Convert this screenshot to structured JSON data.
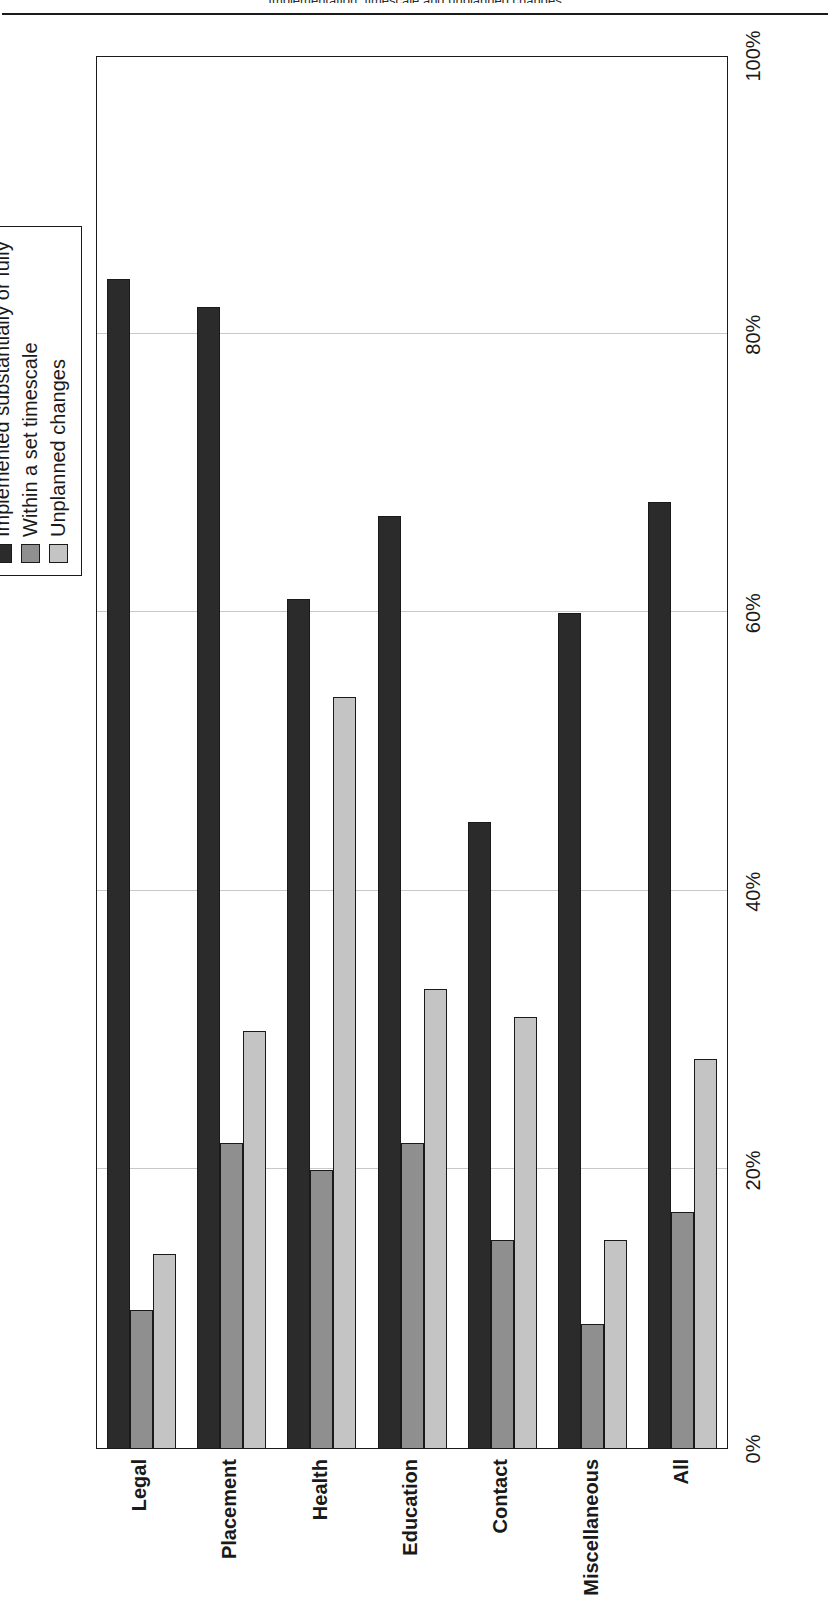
{
  "page_header": {
    "text": "Implementation, timescale and unplanned changes"
  },
  "legend": {
    "items": [
      {
        "label": "Implemented substantially or fully",
        "color": "#2b2b2b",
        "swatch_name": "legend-swatch-implemented"
      },
      {
        "label": "Within a set timescale",
        "color": "#8f8f8f",
        "swatch_name": "legend-swatch-timescale"
      },
      {
        "label": "Unplanned changes",
        "color": "#c4c4c4",
        "swatch_name": "legend-swatch-unplanned"
      }
    ]
  },
  "axis": {
    "ticks": [
      "0%",
      "20%",
      "40%",
      "60%",
      "80%",
      "100%"
    ],
    "tick_values": [
      0,
      20,
      40,
      60,
      80,
      100
    ]
  },
  "chart_data": {
    "type": "bar",
    "title": "Implementation, timescale and unplanned changes",
    "xlabel": "",
    "ylabel": "",
    "ylim": [
      0,
      100
    ],
    "grid": true,
    "legend_position": "top-right",
    "orientation": "vertical-rendered-rotated",
    "categories": [
      "Legal",
      "Placement",
      "Health",
      "Education",
      "Contact",
      "Miscellaneous",
      "All"
    ],
    "tick_labels": [
      "0%",
      "20%",
      "40%",
      "60%",
      "80%",
      "100%"
    ],
    "series": [
      {
        "name": "Implemented substantially or fully",
        "color": "#2b2b2b",
        "values": [
          84,
          82,
          61,
          67,
          45,
          60,
          68
        ]
      },
      {
        "name": "Within a set timescale",
        "color": "#8f8f8f",
        "values": [
          10,
          22,
          20,
          22,
          15,
          9,
          17
        ]
      },
      {
        "name": "Unplanned changes",
        "color": "#c4c4c4",
        "values": [
          14,
          30,
          54,
          33,
          31,
          15,
          28
        ]
      }
    ]
  }
}
